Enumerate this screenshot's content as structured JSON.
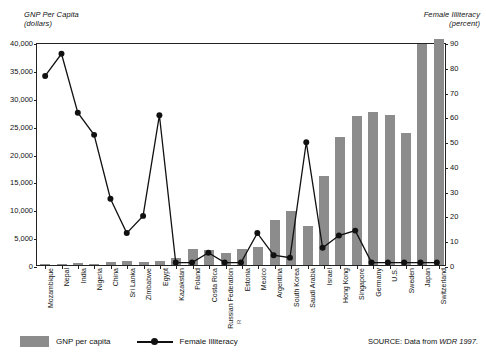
{
  "figure": {
    "left_axis_title_line1": "GNP Per Capita",
    "left_axis_title_line2": "(dollars)",
    "right_axis_title_line1": "Female Illiteracy",
    "right_axis_title_line2": "(percent)",
    "page_marker": "R"
  },
  "legend": {
    "bar_label": "GNP per capita",
    "line_label": "Female Illiteracy"
  },
  "source": {
    "prefix": "SOURCE:  Data from ",
    "reference": "WDR 1997."
  },
  "colors": {
    "bar_fill": "#8c8c8c",
    "line_stroke": "#111111",
    "axis": "#222222",
    "text": "#111111"
  },
  "chart_data": {
    "type": "bar",
    "title": "",
    "subtitle": "",
    "xlabel": "",
    "ylabel": "GNP Per Capita (dollars)",
    "y2label": "Female Illiteracy (percent)",
    "ylim": [
      0,
      40000
    ],
    "y2lim": [
      0,
      90
    ],
    "yticks": [
      "0",
      "5,000",
      "10,000",
      "15,000",
      "20,000",
      "25,000",
      "30,000",
      "35,000",
      "40,000"
    ],
    "ytick_values": [
      0,
      5000,
      10000,
      15000,
      20000,
      25000,
      30000,
      35000,
      40000
    ],
    "y2ticks": [
      "0",
      "10",
      "20",
      "30",
      "40",
      "50",
      "60",
      "70",
      "80",
      "90"
    ],
    "y2tick_values": [
      0,
      10,
      20,
      30,
      40,
      50,
      60,
      70,
      80,
      90
    ],
    "grid": false,
    "legend_position": "bottom-left",
    "categories": [
      "Mozambique",
      "Nepal",
      "India",
      "Nigeria",
      "China",
      "Sri Lanka",
      "Zimbabwe",
      "Egypt",
      "Kazakstan",
      "Poland",
      "Costa Rica",
      "Russian Federation",
      "Estonia",
      "Mexico",
      "Argentina",
      "South Korea",
      "Saudi Arabia",
      "Israel",
      "Hong Kong",
      "Singapore",
      "Germany",
      "U.S.",
      "Sweden",
      "Japan",
      "Switzerland"
    ],
    "series": [
      {
        "name": "GNP per capita",
        "type": "bar",
        "axis": "left",
        "unit": "dollars",
        "values": [
          80,
          200,
          340,
          260,
          620,
          700,
          540,
          790,
          1330,
          2790,
          2610,
          2240,
          2860,
          3320,
          8030,
          9700,
          7040,
          15920,
          22990,
          26730,
          27510,
          26980,
          23750,
          39640,
          40630
        ]
      },
      {
        "name": "Female Illiteracy",
        "type": "line",
        "axis": "right",
        "unit": "percent",
        "values": [
          77,
          86,
          62,
          53,
          27,
          13,
          20,
          61,
          1,
          1,
          5,
          1,
          1,
          13,
          4,
          3,
          50,
          7,
          12,
          14,
          1,
          1,
          1,
          1,
          1
        ]
      }
    ]
  }
}
